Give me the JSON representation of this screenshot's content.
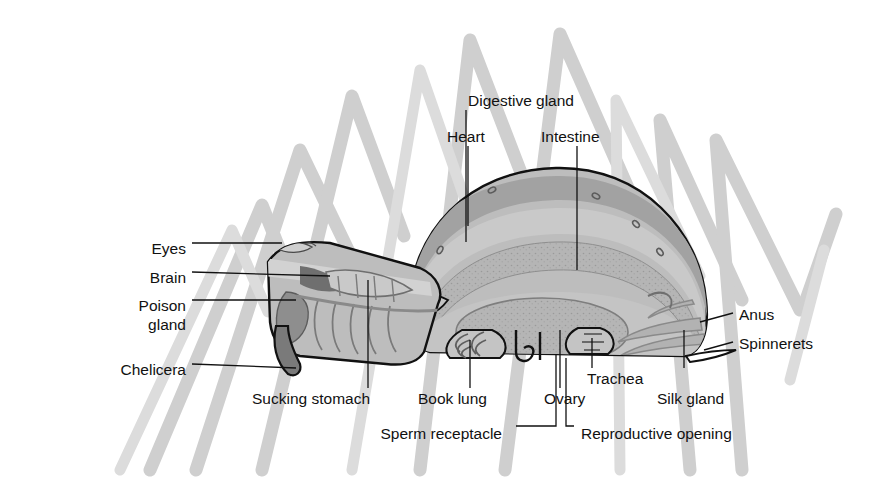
{
  "diagram": {
    "type": "labeled anatomical cross-section",
    "background_color": "#ffffff",
    "leader_line_color": "#111111",
    "leg_silhouette_color": "#cfcfcf",
    "body_outline_color": "#111111",
    "body_fill_color": "#bdbdbd",
    "organ_shades": {
      "pale": "#d2d2d2",
      "mid": "#b0b0b0",
      "dark": "#8e8e8e",
      "darkest": "#6f6f6f"
    }
  },
  "labels": [
    {
      "id": "digestive-gland",
      "text": "Digestive gland",
      "x": 468,
      "y": 100,
      "align": "left"
    },
    {
      "id": "heart",
      "text": "Heart",
      "x": 447,
      "y": 136,
      "align": "left"
    },
    {
      "id": "intestine",
      "text": "Intestine",
      "x": 541,
      "y": 136,
      "align": "left"
    },
    {
      "id": "eyes",
      "text": "Eyes",
      "x": 186,
      "y": 248,
      "align": "right"
    },
    {
      "id": "brain",
      "text": "Brain",
      "x": 186,
      "y": 277,
      "align": "right"
    },
    {
      "id": "poison-gland",
      "text": "Poison",
      "x": 186,
      "y": 305,
      "align": "right"
    },
    {
      "id": "poison-gland-2",
      "text": "gland",
      "x": 186,
      "y": 324,
      "align": "right"
    },
    {
      "id": "chelicera",
      "text": "Chelicera",
      "x": 186,
      "y": 369,
      "align": "right"
    },
    {
      "id": "anus",
      "text": "Anus",
      "x": 739,
      "y": 318,
      "align": "left"
    },
    {
      "id": "spinnerets",
      "text": "Spinnerets",
      "x": 739,
      "y": 347,
      "align": "left"
    },
    {
      "id": "sucking-stomach",
      "text": "Sucking stomach",
      "x": 252,
      "y": 395,
      "align": "left"
    },
    {
      "id": "book-lung",
      "text": "Book lung",
      "x": 418,
      "y": 395,
      "align": "left"
    },
    {
      "id": "ovary",
      "text": "Ovary",
      "x": 544,
      "y": 395,
      "align": "left"
    },
    {
      "id": "trachea",
      "text": "Trachea",
      "x": 587,
      "y": 375,
      "align": "left"
    },
    {
      "id": "silk-gland",
      "text": "Silk gland",
      "x": 657,
      "y": 395,
      "align": "left"
    },
    {
      "id": "sperm-receptacle",
      "text": "Sperm receptacle",
      "x": 352,
      "y": 432,
      "align": "left"
    },
    {
      "id": "reproductive-opening",
      "text": "Reproductive opening",
      "x": 581,
      "y": 432,
      "align": "left"
    }
  ]
}
